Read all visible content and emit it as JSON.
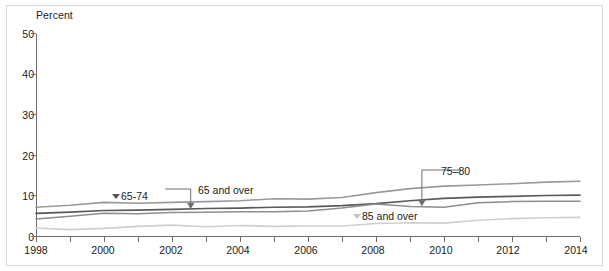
{
  "chart_data": {
    "type": "line",
    "title": "",
    "subtitle": "",
    "xlabel": "",
    "ylabel": "Percent",
    "ylim": [
      0,
      50
    ],
    "xlim": [
      1998,
      2014
    ],
    "ytick_values": [
      0,
      10,
      20,
      30,
      40,
      50
    ],
    "ytick_labels": [
      "0",
      "10",
      "20",
      "30",
      "40",
      "50"
    ],
    "xtick_values": [
      1998,
      1999,
      2000,
      2001,
      2002,
      2003,
      2004,
      2005,
      2006,
      2007,
      2008,
      2009,
      2010,
      2011,
      2012,
      2013,
      2014
    ],
    "xtick_labels": [
      "1998",
      "",
      "2000",
      "",
      "2002",
      "",
      "2004",
      "",
      "2006",
      "",
      "2008",
      "",
      "2010",
      "",
      "2012",
      "",
      "2014"
    ],
    "xtick_labels_shown": [
      "1998",
      "2000",
      "2002",
      "2004",
      "2006",
      "2008",
      "2010",
      "2012",
      "2014"
    ],
    "grid": false,
    "legend_position": "inline-annotations",
    "x": [
      1998,
      1999,
      2000,
      2001,
      2002,
      2003,
      2004,
      2005,
      2006,
      2007,
      2008,
      2009,
      2010,
      2011,
      2012,
      2013,
      2014
    ],
    "series": [
      {
        "name": "65-74",
        "color": "#9a9a9a",
        "width": 1.6,
        "values": [
          7.2,
          7.7,
          8.4,
          8.2,
          8.4,
          8.6,
          8.8,
          9.3,
          9.2,
          9.6,
          10.8,
          11.8,
          12.4,
          12.7,
          13.0,
          13.4,
          13.6
        ]
      },
      {
        "name": "65 and over",
        "color": "#5a5a5a",
        "width": 1.7,
        "values": [
          5.7,
          6.0,
          6.4,
          6.5,
          6.7,
          6.9,
          7.0,
          7.2,
          7.3,
          7.6,
          8.1,
          8.8,
          9.4,
          9.7,
          9.9,
          10.1,
          10.2
        ]
      },
      {
        "name": "75-80",
        "color": "#8e8e8e",
        "width": 1.5,
        "values": [
          4.3,
          5.0,
          5.7,
          5.6,
          5.9,
          6.0,
          6.1,
          6.1,
          6.3,
          7.0,
          8.0,
          7.4,
          7.2,
          8.3,
          8.6,
          8.7,
          8.7
        ]
      },
      {
        "name": "85 and over",
        "color": "#cfcfcf",
        "width": 1.6,
        "values": [
          2.1,
          1.7,
          2.0,
          2.5,
          2.8,
          2.4,
          2.7,
          2.5,
          2.6,
          2.6,
          3.2,
          3.4,
          3.3,
          4.0,
          4.4,
          4.6,
          4.7
        ]
      }
    ],
    "annotations": [
      {
        "text": "65-74",
        "marker": "triangle-down-dark",
        "style": "marker-left"
      },
      {
        "text": "65 and over",
        "marker": "arrow-down",
        "style": "leader-elbow"
      },
      {
        "text": "75–80",
        "marker": "arrow-down",
        "style": "leader-elbow"
      },
      {
        "text": "85 and over",
        "marker": "triangle-down-light",
        "style": "marker-left"
      }
    ],
    "colors": {
      "axis": "#6e6e6e",
      "text": "#1b1b1b",
      "frame": "#d8d8d8",
      "annotation_arrow": "#6e6e6e"
    }
  },
  "labels": {
    "y_axis_title": "Percent",
    "ytick_50": "50",
    "ytick_40": "40",
    "ytick_30": "30",
    "ytick_20": "20",
    "ytick_10": "10",
    "ytick_0": "0",
    "xtick_1998": "1998",
    "xtick_2000": "2000",
    "xtick_2002": "2002",
    "xtick_2004": "2004",
    "xtick_2006": "2006",
    "xtick_2008": "2008",
    "xtick_2010": "2010",
    "xtick_2012": "2012",
    "xtick_2014": "2014",
    "ann_6574": "65-74",
    "ann_65_and_over": "65 and over",
    "ann_7580": "75–80",
    "ann_85_and_over": "85 and over"
  }
}
